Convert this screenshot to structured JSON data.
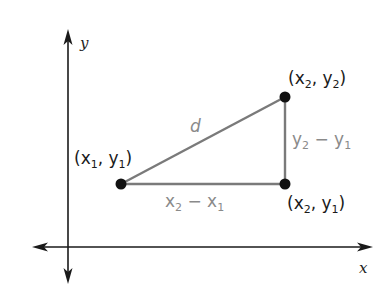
{
  "diagram": {
    "axes": {
      "x_label": "x",
      "y_label": "y"
    },
    "points": [
      {
        "id": "p1",
        "label_open": "(x",
        "sub1": "1",
        "mid": ", y",
        "sub2": "1",
        "label_close": ")",
        "text": "(x1, y1)"
      },
      {
        "id": "p2",
        "label_open": "(x",
        "sub1": "2",
        "mid": ", y",
        "sub2": "2",
        "label_close": ")",
        "text": "(x2, y2)"
      },
      {
        "id": "p3",
        "label_open": "(x",
        "sub1": "2",
        "mid": ", y",
        "sub2": "1",
        "label_close": ")",
        "text": "(x2, y1)"
      }
    ],
    "segments": {
      "hypotenuse": {
        "label": "d"
      },
      "horizontal": {
        "a": "x",
        "a_sub": "2",
        "op": " − x",
        "b_sub": "1",
        "text": "x2 − x1"
      },
      "vertical": {
        "a": "y",
        "a_sub": "2",
        "op": " − y",
        "b_sub": "1",
        "text": "y2 − y1"
      }
    },
    "colors": {
      "axis": "#1a1a1a",
      "segment": "#7a7a7a",
      "point": "#111111",
      "gray_label": "#8a8a8a"
    }
  }
}
